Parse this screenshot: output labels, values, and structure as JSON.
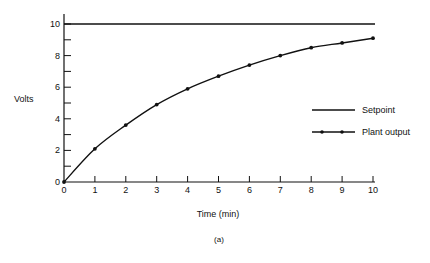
{
  "chart_data": {
    "type": "line",
    "title": "",
    "caption": "(a)",
    "xlabel": "Time (min)",
    "ylabel": "Volts",
    "xlim": [
      0,
      10
    ],
    "ylim": [
      0,
      10
    ],
    "x_ticks": [
      0,
      1,
      2,
      3,
      4,
      5,
      6,
      7,
      8,
      9,
      10
    ],
    "y_tick_labels": [
      0,
      2,
      4,
      6,
      8,
      10
    ],
    "y_minor_ticks": [
      1,
      3,
      5,
      7,
      9
    ],
    "grid": false,
    "legend_position": "right-middle",
    "x": [
      0,
      1,
      2,
      3,
      4,
      5,
      6,
      7,
      8,
      9,
      10
    ],
    "series": [
      {
        "name": "Setpoint",
        "values": [
          10,
          10,
          10,
          10,
          10,
          10,
          10,
          10,
          10,
          10,
          10
        ],
        "markers": false
      },
      {
        "name": "Plant output",
        "values": [
          0,
          2.1,
          3.6,
          4.9,
          5.9,
          6.7,
          7.4,
          8.0,
          8.5,
          8.8,
          9.1
        ],
        "markers": true
      }
    ]
  },
  "labels": {
    "ylabel": "Volts",
    "xlabel": "Time (min)",
    "caption": "(a)",
    "legend_setpoint": "Setpoint",
    "legend_plant": "Plant output"
  }
}
